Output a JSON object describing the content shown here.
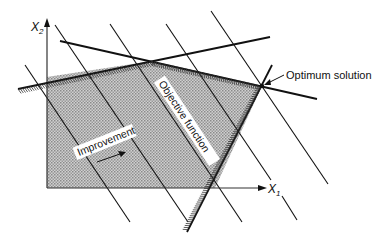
{
  "diagram": {
    "axes": {
      "x_label": "X",
      "x_subscript": "1",
      "y_label": "X",
      "y_subscript": "2"
    },
    "labels": {
      "objective": "Objective function",
      "improvement": "Improvement",
      "optimum": "Optimum solution"
    },
    "regions": {
      "feasible": "Feasible region (shaded)"
    },
    "colors": {
      "ink": "#111111",
      "shade": "#b8b8b8",
      "background": "#ffffff"
    }
  }
}
